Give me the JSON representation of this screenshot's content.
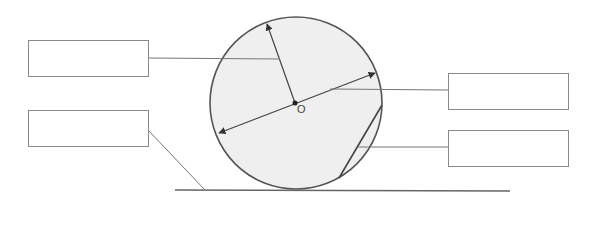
{
  "diagram": {
    "type": "circle-parts-labeling",
    "center_label": "O",
    "colors": {
      "circle_fill": "#efefef",
      "circle_stroke": "#555555",
      "line": "#777777",
      "box_border": "#8a8a8a"
    },
    "label_boxes": [
      {
        "id": "box-radius",
        "text": "",
        "points_to": "radius"
      },
      {
        "id": "box-tangent",
        "text": "",
        "points_to": "tangent-line"
      },
      {
        "id": "box-diameter",
        "text": "",
        "points_to": "diameter"
      },
      {
        "id": "box-chord",
        "text": "",
        "points_to": "chord"
      }
    ]
  }
}
